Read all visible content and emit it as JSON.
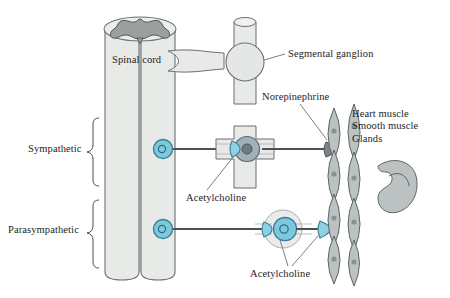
{
  "figure": {
    "background_color": "#ffffff"
  },
  "labels": {
    "spinal_cord": "Spinal cord",
    "segmental_ganglion": "Segmental ganglion",
    "norepinephrine": "Norepinephrine",
    "sympathetic": "Sympathetic",
    "parasympathetic": "Parasympathetic",
    "acetylcholine_preganglionic": "Acetylcholine",
    "acetylcholine_postganglionic": "Acetylcholine"
  },
  "targets": {
    "items": [
      "Heart muscle",
      "Smooth muscle",
      "Glands"
    ]
  },
  "colors": {
    "spinal_cord_fill": "#e6e8e6",
    "spinal_cord_stroke": "#6b6f70",
    "gray_matter_fill": "#9aa09e",
    "neuron_blue_fill": "#7ec8dd",
    "neuron_blue_stroke": "#3a7f96",
    "neuron_nucleus_stroke": "#2e6d84",
    "ganglion_body_fill": "#9fb0b8",
    "ganglion_nucleus_fill": "#6f7b80",
    "ganglion_sheath_fill": "#e8eaea",
    "axon_stroke": "#4a5254",
    "target_cell_fill": "#b9bfbe",
    "target_cell_stroke": "#5f6566",
    "gland_fill": "#b9bfbe",
    "text": "#1d1d1d",
    "leader_line": "#6b6f70"
  }
}
